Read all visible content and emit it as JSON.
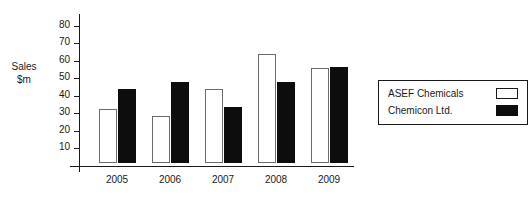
{
  "chart_data": {
    "type": "bar",
    "title": "",
    "title_clipped": true,
    "categories": [
      "2005",
      "2006",
      "2007",
      "2008",
      "2009"
    ],
    "series": [
      {
        "name": "ASEF Chemicals",
        "values": [
          31,
          27,
          42,
          62,
          54
        ],
        "color": "#ffffff"
      },
      {
        "name": "Chemicon Ltd.",
        "values": [
          42,
          46,
          32,
          46,
          55
        ],
        "color": "#0d0d0d"
      }
    ],
    "xlabel": "",
    "ylabel": "Sales $m",
    "ylabel_lines": [
      "Sales",
      "$m"
    ],
    "ylim": [
      0,
      85
    ],
    "yticks": [
      10,
      20,
      30,
      40,
      50,
      60,
      70,
      80
    ],
    "ytick_labels": [
      "10",
      "20",
      "30",
      "40",
      "50",
      "60",
      "70",
      "80"
    ],
    "grid": false,
    "legend_position": "right"
  },
  "legend": {
    "entries": [
      {
        "label": "ASEF Chemicals",
        "swatch": "white-square-outline"
      },
      {
        "label": "Chemicon Ltd.",
        "swatch": "black-square-filled"
      }
    ]
  }
}
